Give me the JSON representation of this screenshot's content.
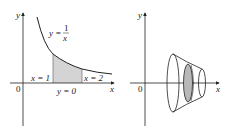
{
  "figure_left": {
    "axis_x_label": "x",
    "axis_y_label": "y",
    "origin_label": "0",
    "curve_label_lhs": "y =",
    "curve_label_num": "1",
    "curve_label_den": "x",
    "bound_left": "x = 1",
    "bound_right": "x = 2",
    "bound_bottom": "y = 0",
    "shade_color": "#d4d4d4"
  },
  "figure_right": {
    "axis_x_label": "x",
    "axis_y_label": "y",
    "origin_label": "0",
    "shade_color": "#b8b8b8"
  }
}
